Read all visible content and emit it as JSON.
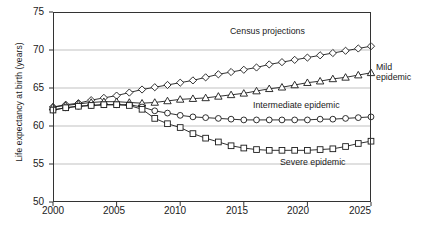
{
  "chart_data": {
    "type": "line",
    "title": "",
    "xlabel": "",
    "ylabel": "Life expectancy at birth (years)",
    "xlim": [
      2000,
      2025
    ],
    "ylim": [
      50,
      75
    ],
    "grid": "horizontal",
    "legend_position": "inline-annotations",
    "x_ticks": [
      "2000",
      "2005",
      "2010",
      "2015",
      "2020",
      "2025"
    ],
    "y_ticks": [
      "50",
      "55",
      "60",
      "65",
      "70",
      "75"
    ],
    "x": [
      2000,
      2001,
      2002,
      2003,
      2004,
      2005,
      2006,
      2007,
      2008,
      2009,
      2010,
      2011,
      2012,
      2013,
      2014,
      2015,
      2016,
      2017,
      2018,
      2019,
      2020,
      2021,
      2022,
      2023,
      2024,
      2025
    ],
    "series": [
      {
        "name": "Census projections",
        "marker": "diamond",
        "annotation": "Census  projections",
        "values": [
          62.5,
          62.8,
          63.0,
          63.4,
          63.7,
          64.0,
          64.4,
          64.8,
          65.1,
          65.4,
          65.7,
          66.0,
          66.4,
          66.8,
          67.1,
          67.4,
          67.7,
          68.1,
          68.4,
          68.7,
          69.0,
          69.3,
          69.6,
          69.9,
          70.2,
          70.5
        ]
      },
      {
        "name": "Mild epidemic",
        "marker": "triangle",
        "annotation": "Mild epidemic",
        "values": [
          62.5,
          62.7,
          62.9,
          63.1,
          63.2,
          63.2,
          63.1,
          63.0,
          63.1,
          63.3,
          63.5,
          63.6,
          63.7,
          63.9,
          64.1,
          64.3,
          64.6,
          64.9,
          65.1,
          65.4,
          65.7,
          65.9,
          66.2,
          66.4,
          66.7,
          67.0
        ]
      },
      {
        "name": "Intermediate epidemic",
        "marker": "circle",
        "annotation": "Intermediate epidemic",
        "values": [
          62.1,
          62.4,
          62.6,
          62.7,
          62.8,
          62.8,
          62.8,
          62.5,
          62.0,
          61.7,
          61.4,
          61.2,
          61.1,
          61.0,
          60.9,
          60.8,
          60.8,
          60.8,
          60.8,
          60.8,
          60.8,
          60.9,
          60.9,
          61.0,
          61.1,
          61.2
        ]
      },
      {
        "name": "Severe epidemic",
        "marker": "square",
        "annotation": "Severe epidemic",
        "values": [
          62.1,
          62.4,
          62.6,
          62.7,
          62.8,
          62.8,
          62.7,
          62.2,
          61.0,
          60.3,
          59.8,
          59.0,
          58.4,
          57.9,
          57.4,
          57.1,
          56.9,
          56.8,
          56.8,
          56.8,
          56.8,
          56.9,
          57.0,
          57.3,
          57.7,
          58.0
        ]
      }
    ],
    "annotations": [
      {
        "id": "census",
        "text": "Census  projections"
      },
      {
        "id": "mild_line1",
        "text": "Mild"
      },
      {
        "id": "mild_line2",
        "text": "epidemic"
      },
      {
        "id": "intermediate",
        "text": "Intermediate epidemic"
      },
      {
        "id": "severe",
        "text": "Severe epidemic"
      }
    ],
    "colors": {
      "line": "#1a1a1a",
      "marker_fill": "#ffffff",
      "grid": "#a6a6a6",
      "frame": "#333333",
      "background": "#ffffff"
    }
  }
}
